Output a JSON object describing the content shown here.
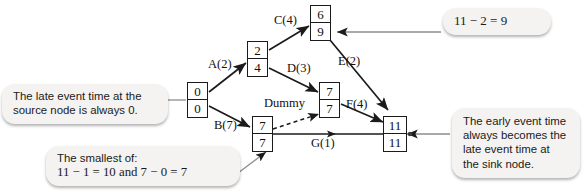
{
  "diagram": {
    "type": "activity-network-pert-cpm",
    "nodes": [
      {
        "id": "source",
        "early": "0",
        "late": "0"
      },
      {
        "id": "a-end",
        "early": "2",
        "late": "4"
      },
      {
        "id": "c-end",
        "early": "6",
        "late": "9"
      },
      {
        "id": "d-end",
        "early": "7",
        "late": "7"
      },
      {
        "id": "b-end",
        "early": "7",
        "late": "7"
      },
      {
        "id": "sink",
        "early": "11",
        "late": "11"
      }
    ],
    "edges": [
      {
        "id": "a",
        "label": "A(2)"
      },
      {
        "id": "b",
        "label": "B(7)"
      },
      {
        "id": "c",
        "label": "C(4)"
      },
      {
        "id": "d",
        "label": "D(3)"
      },
      {
        "id": "e",
        "label": "E(2)"
      },
      {
        "id": "f",
        "label": "F(4)"
      },
      {
        "id": "g",
        "label": "G(1)"
      },
      {
        "id": "dummy",
        "label": "Dummy"
      }
    ]
  },
  "callouts": {
    "late_source": {
      "line1": "The late event time at the",
      "line2": "source node is always 0."
    },
    "subtract": {
      "line1": "11 − 2 = 9"
    },
    "smallest": {
      "line1": "The smallest of:",
      "line2": "11 − 1 = 10 and 7 − 0 = 7"
    },
    "early_sink": {
      "line1": "The early event time",
      "line2": "always becomes the",
      "line3": "late event time at",
      "line4": "the sink node."
    }
  },
  "colors": {
    "node_border": "#1b1b1b",
    "edge_stroke": "#1b1b1b",
    "callout_bg": "#f4f3f1",
    "leader_line": "#8d8d8d",
    "page_bg": "#ffffff"
  }
}
